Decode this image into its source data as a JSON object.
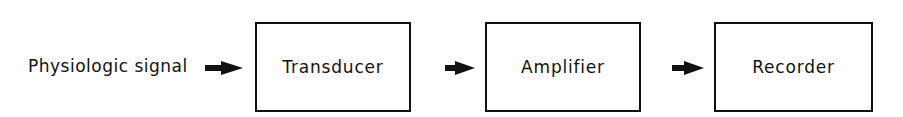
{
  "diagram": {
    "input_label": "Physiologic signal",
    "blocks": [
      {
        "label": "Transducer"
      },
      {
        "label": "Amplifier"
      },
      {
        "label": "Recorder"
      }
    ],
    "arrows": [
      "input-to-transducer",
      "transducer-to-amplifier",
      "amplifier-to-recorder"
    ],
    "colors": {
      "stroke": "#111111",
      "background": "#ffffff"
    }
  }
}
